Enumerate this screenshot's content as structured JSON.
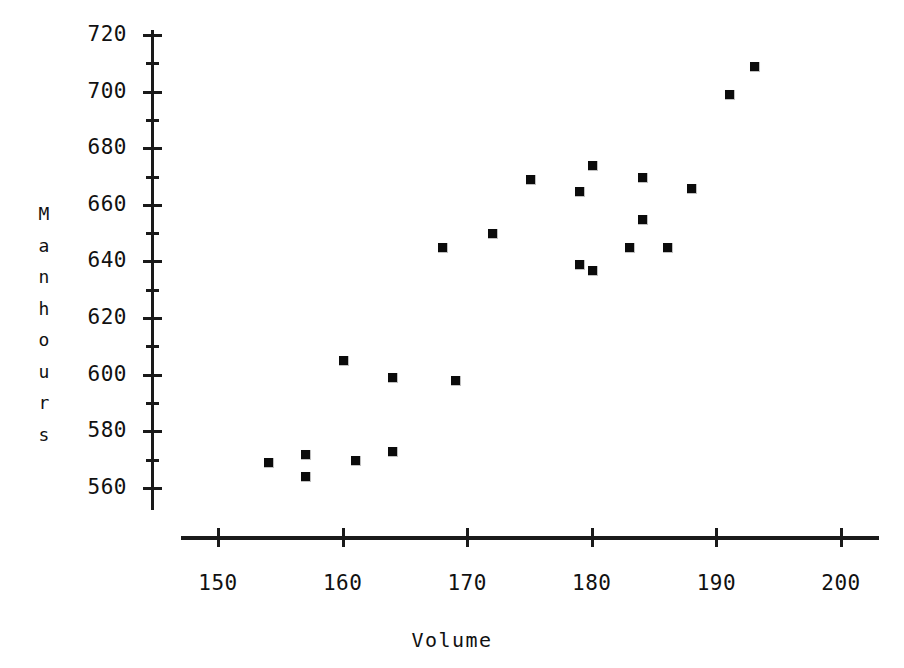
{
  "chart_data": {
    "type": "scatter",
    "title": "",
    "xlabel": "Volume",
    "ylabel": "Manhours",
    "ylabel_letters": [
      "M",
      "a",
      "n",
      "h",
      "o",
      "u",
      "r",
      "s"
    ],
    "xlim": [
      146,
      204
    ],
    "ylim": [
      553,
      723
    ],
    "xticks": [
      150,
      160,
      170,
      180,
      190,
      200
    ],
    "xtick_labels": [
      "150",
      "160",
      "170",
      "180",
      "190",
      "200"
    ],
    "yticks": [
      560,
      580,
      600,
      620,
      640,
      660,
      680,
      700,
      720
    ],
    "ytick_labels": [
      "560",
      "580",
      "600",
      "620",
      "640",
      "660",
      "680",
      "700",
      "720"
    ],
    "yticks_minor": [
      570,
      590,
      610,
      630,
      650,
      670,
      690,
      710
    ],
    "grid": false,
    "legend": null,
    "marker_style": "filled-square",
    "marker_color": "#0b0b0b",
    "axis_color": "#1a1a1a",
    "background_color": "#ffffff",
    "n_points": 22,
    "points": [
      {
        "x": 154,
        "y": 569
      },
      {
        "x": 157,
        "y": 572
      },
      {
        "x": 157,
        "y": 564
      },
      {
        "x": 161,
        "y": 570
      },
      {
        "x": 164,
        "y": 573
      },
      {
        "x": 160,
        "y": 605
      },
      {
        "x": 164,
        "y": 599
      },
      {
        "x": 169,
        "y": 598
      },
      {
        "x": 168,
        "y": 645
      },
      {
        "x": 172,
        "y": 650
      },
      {
        "x": 175,
        "y": 669
      },
      {
        "x": 179,
        "y": 665
      },
      {
        "x": 180,
        "y": 674
      },
      {
        "x": 179,
        "y": 639
      },
      {
        "x": 180,
        "y": 637
      },
      {
        "x": 183,
        "y": 645
      },
      {
        "x": 184,
        "y": 670
      },
      {
        "x": 184,
        "y": 655
      },
      {
        "x": 186,
        "y": 645
      },
      {
        "x": 188,
        "y": 666
      },
      {
        "x": 191,
        "y": 699
      },
      {
        "x": 193,
        "y": 709
      }
    ]
  },
  "geometry": {
    "y_axis": {
      "x_px": 151,
      "top_px": 30,
      "bottom_px": 510,
      "thickness_px": 3
    },
    "x_axis": {
      "y_px": 536,
      "left_px": 181,
      "right_px": 879,
      "thickness_px": 4
    },
    "x_scale": {
      "value_at_px": 150,
      "px": 218,
      "px_per_unit": 12.46
    },
    "y_scale": {
      "value_at_px": 720,
      "px": 35,
      "px_per_unit": 2.83
    },
    "major_tick_len_px": 19,
    "minor_tick_len_px": 13,
    "x_tick_len_px": 19
  }
}
